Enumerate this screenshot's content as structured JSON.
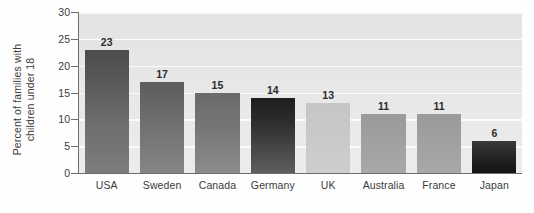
{
  "chart_data": {
    "type": "bar",
    "title": "",
    "subtitle": "",
    "xlabel": "",
    "ylabel_lines": [
      "Percent of families with",
      "children under 18"
    ],
    "ylabel": "Percent of families with children under 18",
    "categories": [
      "USA",
      "Sweden",
      "Canada",
      "Germany",
      "UK",
      "Australia",
      "France",
      "Japan"
    ],
    "values": [
      23,
      17,
      15,
      14,
      13,
      11,
      11,
      6
    ],
    "value_labels": [
      "23",
      "17",
      "15",
      "14",
      "13",
      "11",
      "11",
      "6"
    ],
    "ylim": [
      0,
      30
    ],
    "ytick_values": [
      0,
      5,
      10,
      15,
      20,
      25,
      30
    ],
    "ytick_labels": [
      "0",
      "5",
      "10",
      "15",
      "20",
      "25",
      "30"
    ],
    "grid": "horizontal",
    "legend": "none",
    "bar_fills": [
      "linear-gradient(180deg,#4c4c4c 0%,#5a5a5a 28%,#6e6e6e 62%,#7d7d7d 100%)",
      "linear-gradient(180deg,#5c5c5c 0%,#6a6a6a 35%,#7a7a7a 70%,#858585 100%)",
      "linear-gradient(180deg,#6a6a6a 0%,#757575 40%,#828282 75%,#8c8c8c 100%)",
      "linear-gradient(180deg,#1d1d1d 0%,#2c2c2c 30%,#454545 65%,#5e5e5e 100%)",
      "linear-gradient(180deg,#c6c6c6 0%,#c9c9c9 50%,#cdcdcd 100%)",
      "linear-gradient(180deg,#9a9a9a 0%,#a0a0a0 45%,#a8a8a8 100%)",
      "linear-gradient(180deg,#9a9a9a 0%,#a0a0a0 45%,#a8a8a8 100%)",
      "linear-gradient(180deg,#3a3a3a 0%,#2b2b2b 35%,#1d1d1d 70%,#151515 100%)"
    ],
    "colors": {
      "plot_background": "#e8e8e8",
      "gridline": "#fbfbfb",
      "axis": "#6d6d6d",
      "text": "#3b3b3b",
      "value_label": "#2b2b2b",
      "page_background": "#ffffff"
    }
  }
}
